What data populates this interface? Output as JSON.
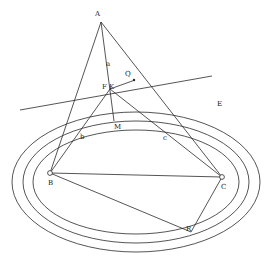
{
  "diagram": {
    "title": "",
    "stroke_color": "#2a2a2a",
    "background": "#ffffff",
    "points": {
      "A": {
        "label": "A",
        "x": 101,
        "y": 22
      },
      "F": {
        "label": "F",
        "x": 107,
        "y": 89
      },
      "K": {
        "label": "K",
        "x": 112,
        "y": 89
      },
      "B": {
        "label": "B",
        "x": 50,
        "y": 173
      },
      "C": {
        "label": "C",
        "x": 222,
        "y": 177
      },
      "R": {
        "label": "R",
        "x": 191,
        "y": 232
      },
      "M": {
        "label": "M",
        "x": 116,
        "y": 127
      },
      "Q": {
        "label": "Q",
        "x": 128,
        "y": 74
      },
      "E": {
        "label": "E",
        "x": 219,
        "y": 104
      }
    },
    "segment_labels": {
      "a": "a",
      "b": "b",
      "c": "c"
    },
    "labels": {
      "A": "A",
      "F": "F",
      "K": "K",
      "B": "B",
      "C": "C",
      "R": "R",
      "M": "M",
      "Q": "Q",
      "E": "E",
      "a": "a",
      "b": "b",
      "c": "c"
    },
    "ellipses": [
      {
        "name": "inner",
        "cx": 136,
        "cy": 182,
        "rx": 103,
        "ry": 52
      },
      {
        "name": "middle",
        "cx": 136,
        "cy": 182,
        "rx": 113,
        "ry": 61
      },
      {
        "name": "outer",
        "cx": 136,
        "cy": 182,
        "rx": 124,
        "ry": 70
      }
    ]
  }
}
